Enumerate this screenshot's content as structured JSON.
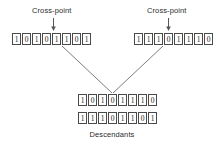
{
  "diagram": {
    "title_labels": {
      "cross_point_left": "Cross-point",
      "cross_point_right": "Cross-point",
      "descendants": "Descendants"
    },
    "parents": [
      {
        "name": "parent-left",
        "bits": [
          "1",
          "0",
          "1",
          "0",
          "1",
          "1",
          "0",
          "1"
        ],
        "cross_point_index": 4
      },
      {
        "name": "parent-right",
        "bits": [
          "1",
          "1",
          "1",
          "0",
          "1",
          "1",
          "1",
          "0"
        ],
        "cross_point_index": 4
      }
    ],
    "descendants": [
      {
        "name": "descendant-one",
        "bits": [
          "1",
          "0",
          "1",
          "0",
          "1",
          "1",
          "1",
          "0"
        ]
      },
      {
        "name": "descendant-two",
        "bits": [
          "1",
          "1",
          "1",
          "0",
          "1",
          "1",
          "0",
          "1"
        ]
      }
    ],
    "colors": {
      "background": "#ffffff",
      "box_border": "#4a4a4a",
      "text": "#1a1a1a",
      "label_text": "#2b2b2b",
      "line": "#6e6e6e"
    }
  }
}
